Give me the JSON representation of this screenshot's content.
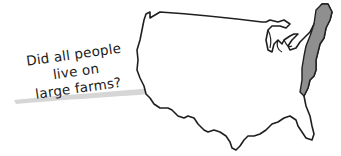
{
  "illustration": {
    "note": {
      "lines": [
        "Did all people",
        "live on",
        "large farms?"
      ]
    },
    "map": {
      "subject": "United States outline",
      "highlighted_region": "eastern seaboard (original colonies)",
      "outline_color": "#1f1f1f",
      "fill_color": "#ffffff",
      "highlight_color": "#8f8f8f"
    },
    "paper": {
      "color": "#ffffff",
      "shadow_color": "#b5b5b5"
    }
  }
}
